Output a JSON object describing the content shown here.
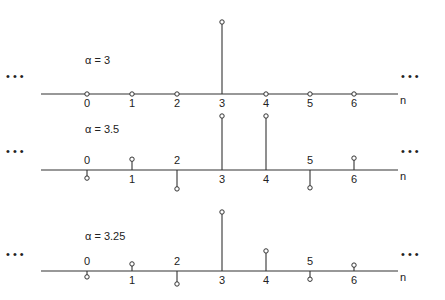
{
  "chart_data": [
    {
      "type": "stem",
      "title": "α = 3",
      "xlabel": "n",
      "x": [
        0,
        1,
        2,
        3,
        4,
        5,
        6
      ],
      "values": [
        0,
        0,
        0,
        1,
        0,
        0,
        0
      ],
      "ellipsis_left": "• • •",
      "ellipsis_right": "• • •"
    },
    {
      "type": "stem",
      "title": "α = 3.5",
      "xlabel": "n",
      "x": [
        0,
        1,
        2,
        3,
        4,
        5,
        6
      ],
      "values": [
        -0.15,
        0.2,
        -0.35,
        1,
        1,
        -0.33,
        0.22
      ],
      "ellipsis_left": "• • •",
      "ellipsis_right": "• • •"
    },
    {
      "type": "stem",
      "title": "α = 3.25",
      "xlabel": "n",
      "x": [
        0,
        1,
        2,
        3,
        4,
        5,
        6
      ],
      "values": [
        -0.1,
        0.12,
        -0.22,
        1,
        0.34,
        -0.14,
        0.1
      ],
      "ellipsis_left": "• • •",
      "ellipsis_right": "• • •"
    }
  ],
  "layout": {
    "axis_x_start": 41,
    "axis_x_end": 398,
    "tick_x": [
      87,
      132,
      177,
      222,
      266,
      310,
      354
    ],
    "panels": [
      {
        "axis_y": 94,
        "scale": 72,
        "label_pos": "below",
        "alpha_x": 85,
        "alpha_y": 64,
        "ell_y": 80
      },
      {
        "axis_y": 170,
        "scale": 54,
        "label_pos": "alternate",
        "alpha_x": 85,
        "alpha_y": 133,
        "ell_y": 155
      },
      {
        "axis_y": 271,
        "scale": 59,
        "label_pos": "alternate",
        "alpha_x": 85,
        "alpha_y": 240,
        "ell_y": 258
      }
    ],
    "stroke": "#333333"
  }
}
